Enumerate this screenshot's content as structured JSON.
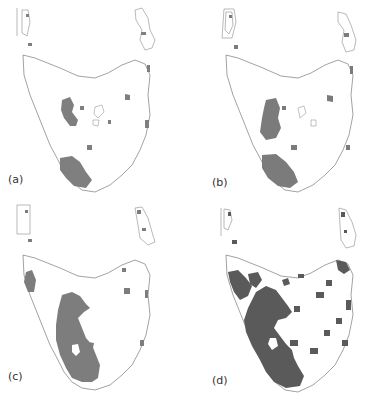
{
  "figure": {
    "region": "Tasmania",
    "panels": [
      {
        "id": "a",
        "label": "(a)",
        "fill": "#7f7f7f"
      },
      {
        "id": "b",
        "label": "(b)",
        "fill": "#7b7b7b"
      },
      {
        "id": "c",
        "label": "(c)",
        "fill": "#7d7d7d"
      },
      {
        "id": "d",
        "label": "(d)",
        "fill": "#5a5a5a"
      }
    ],
    "colors": {
      "background": "#ffffff",
      "coastline": "#7a7a7a",
      "label_text": "#333333"
    }
  }
}
